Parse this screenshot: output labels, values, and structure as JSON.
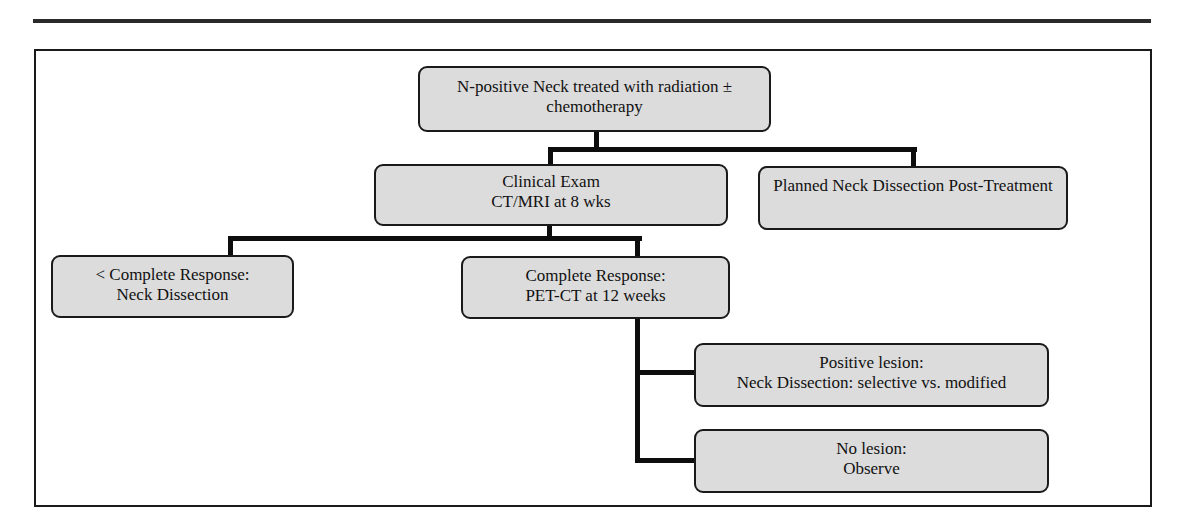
{
  "diagram": {
    "type": "flowchart",
    "nodes": {
      "root": {
        "line1": "N-positive Neck treated with radiation ±",
        "line2": "chemotherapy"
      },
      "clinical_exam": {
        "line1": "Clinical Exam",
        "line2": "CT/MRI at 8 wks"
      },
      "planned_dissection": {
        "line1": "Planned Neck Dissection Post-Treatment",
        "line2": ""
      },
      "incomplete_response": {
        "line1": "< Complete Response:",
        "line2": "Neck Dissection"
      },
      "complete_response": {
        "line1": "Complete Response:",
        "line2": "PET-CT at 12 weeks"
      },
      "positive_lesion": {
        "line1": "Positive lesion:",
        "line2": "Neck Dissection: selective vs. modified"
      },
      "no_lesion": {
        "line1": "No lesion:",
        "line2": "Observe"
      }
    },
    "edges": [
      [
        "root",
        "clinical_exam"
      ],
      [
        "root",
        "planned_dissection"
      ],
      [
        "clinical_exam",
        "incomplete_response"
      ],
      [
        "clinical_exam",
        "complete_response"
      ],
      [
        "complete_response",
        "positive_lesion"
      ],
      [
        "complete_response",
        "no_lesion"
      ]
    ],
    "colors": {
      "node_fill": "#dcdcdc",
      "node_border": "#1a1a1a",
      "connector": "#0d0d0d"
    }
  }
}
